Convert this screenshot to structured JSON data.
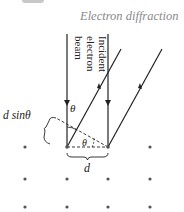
{
  "header": {
    "title": "Electron diffraction"
  },
  "diagram": {
    "beam_label_lines": [
      "Incident",
      "electron",
      "beam"
    ],
    "angle_label": "θ",
    "path_difference_label": "d sinθ",
    "spacing_label": "d",
    "lattice": {
      "rows": 3,
      "columns": 4,
      "dot_color": "#555555"
    },
    "line_color": "#222222"
  }
}
